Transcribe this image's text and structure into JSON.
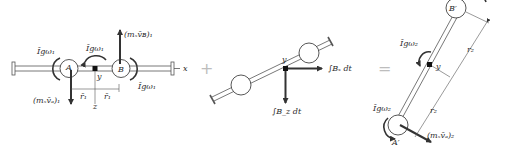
{
  "figure": {
    "type": "impulse-momentum diagram",
    "panels": [
      {
        "id": "initial-momentum",
        "labels": {
          "moment_A": "Īgω₁",
          "moment_center": "Īgω₁",
          "moment_B": "Īgω₁",
          "momentum_A": "(mₛv̄ₐ)₁",
          "momentum_B": "(mₛv̄ʙ)₁",
          "point_A": "A",
          "point_B": "B",
          "center": "y",
          "z_axis": "z",
          "x_axis": "x",
          "r_left": "r̄₁",
          "r_right": "r̄₁"
        }
      },
      {
        "id": "impulse",
        "labels": {
          "center": "y",
          "impulse_x": "∫Bₓ dt",
          "impulse_z": "∫B_z dt"
        }
      },
      {
        "id": "final-momentum",
        "labels": {
          "point_A": "A′",
          "point_B": "B′",
          "center": "y",
          "moment": "Īgω₂",
          "momentum_A": "(mₛv̄ₐ)₂",
          "r_upper": "r₂",
          "r_lower": "r₂"
        }
      }
    ],
    "operators": {
      "plus": "+",
      "equals": "="
    }
  }
}
